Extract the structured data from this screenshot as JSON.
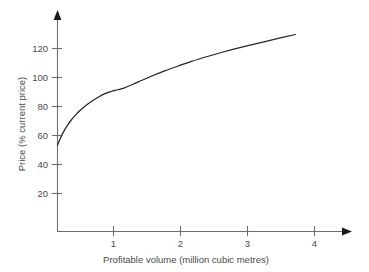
{
  "chart_data": {
    "type": "line",
    "title": "",
    "subtitle": "",
    "xlabel": "Profitable volume (million cubic metres)",
    "ylabel": "Price (% current price)",
    "xlim": [
      0,
      4.55
    ],
    "ylim": [
      0,
      137
    ],
    "xticks": [
      1,
      2,
      3,
      4
    ],
    "xtick_labels": [
      "1",
      "2",
      "3",
      "4"
    ],
    "yticks": [
      20,
      40,
      60,
      80,
      100,
      120
    ],
    "ytick_labels": [
      "20",
      "40",
      "60",
      "80",
      "100",
      "120"
    ],
    "grid": false,
    "legend": null,
    "annotations": [],
    "series": [
      {
        "name": "Price vs profitable volume",
        "color": "#262626",
        "x": [
          0.0,
          0.05,
          0.1,
          0.15,
          0.2,
          0.25,
          0.3,
          0.4,
          0.5,
          0.6,
          0.7,
          0.8,
          0.9,
          1.0,
          1.2,
          1.4,
          1.6,
          1.8,
          2.0,
          2.25,
          2.5,
          2.75,
          3.0,
          3.25,
          3.55
        ],
        "y": [
          53.0,
          58.5,
          63.0,
          66.8,
          70.0,
          72.8,
          75.3,
          79.5,
          83.0,
          85.9,
          88.4,
          90.0,
          91.2,
          92.5,
          96.5,
          100.5,
          104.2,
          107.6,
          110.8,
          114.3,
          117.6,
          120.6,
          123.4,
          126.1,
          129.3
        ]
      }
    ]
  },
  "axes": {
    "y_axis_title": "Price (% current price)",
    "x_axis_title": "Profitable volume (million cubic metres)",
    "y_tick_text": [
      "120",
      "100",
      "80",
      "60",
      "40",
      "20"
    ],
    "x_tick_text": [
      "1",
      "2",
      "3",
      "4"
    ]
  },
  "colors": {
    "background": "#ffffff",
    "axis": "#6e6e6e",
    "text": "#4a4a4a",
    "curve": "#262626",
    "arrow": "#1a1a1a"
  }
}
